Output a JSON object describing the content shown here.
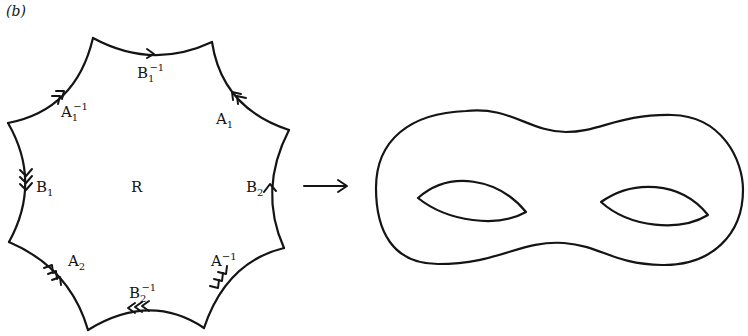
{
  "figure": {
    "panel_label": "(b)",
    "region_label": "R",
    "edges": [
      {
        "id": "top",
        "label": "B",
        "sub": "1",
        "sup": "−1",
        "arrows": 1
      },
      {
        "id": "upper-right",
        "label": "A",
        "sub": "1",
        "sup": "",
        "arrows": 2
      },
      {
        "id": "right",
        "label": "B",
        "sub": "2",
        "sup": "",
        "arrows": 1
      },
      {
        "id": "lower-right",
        "label": "A",
        "sub": "2",
        "sup": "−1",
        "arrows": 3
      },
      {
        "id": "bottom",
        "label": "B",
        "sub": "2",
        "sup": "−1",
        "arrows": 3
      },
      {
        "id": "lower-left",
        "label": "A",
        "sub": "2",
        "sup": "",
        "arrows": 3
      },
      {
        "id": "left",
        "label": "B",
        "sub": "1",
        "sup": "",
        "arrows": 3
      },
      {
        "id": "upper-left",
        "label": "A",
        "sub": "1",
        "sup": "−1",
        "arrows": 2
      }
    ],
    "mapping_arrow": "right-arrow",
    "surface": "genus-2 surface (double torus)",
    "colors": {
      "ink": "#141414",
      "background": "#ffffff"
    }
  }
}
